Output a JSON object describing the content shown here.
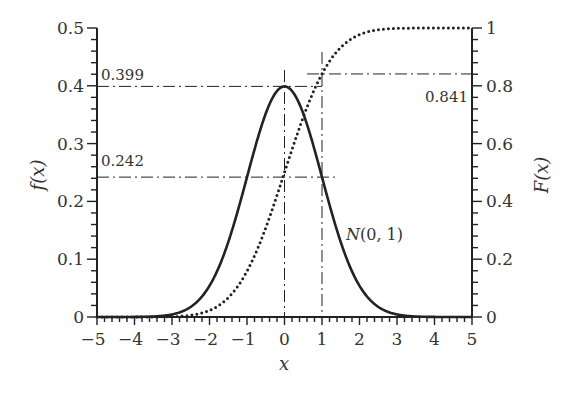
{
  "chart_data": {
    "type": "line",
    "title": "",
    "xlabel": "x",
    "ylabel_left": "f(x)",
    "ylabel_right": "F(x)",
    "xlim": [
      -5,
      5
    ],
    "ylim_left": [
      0,
      0.5
    ],
    "ylim_right": [
      0,
      1
    ],
    "x_ticks": [
      -5,
      -4,
      -3,
      -2,
      -1,
      0,
      1,
      2,
      3,
      4,
      5
    ],
    "x_tick_labels": [
      "−5",
      "−4",
      "−3",
      "−2",
      "−1",
      "0",
      "1",
      "2",
      "3",
      "4",
      "5"
    ],
    "y_left_ticks": [
      0,
      0.1,
      0.2,
      0.3,
      0.4,
      0.5
    ],
    "y_left_tick_labels": [
      "0",
      "0.1",
      "0.2",
      "0.3",
      "0.4",
      "0.5"
    ],
    "y_right_ticks": [
      0,
      0.2,
      0.4,
      0.6,
      0.8,
      1
    ],
    "y_right_tick_labels": [
      "0",
      "0.2",
      "0.4",
      "0.6",
      "0.8",
      "1"
    ],
    "grid": false,
    "series": [
      {
        "name": "f(x) — N(0,1) density",
        "style": "solid",
        "axis": "left",
        "x": [
          -5,
          -4,
          -3,
          -2,
          -1,
          0,
          1,
          2,
          3,
          4,
          5
        ],
        "values": [
          1.5e-06,
          0.000134,
          0.00443,
          0.054,
          0.242,
          0.399,
          0.242,
          0.054,
          0.00443,
          0.000134,
          1.5e-06
        ]
      },
      {
        "name": "F(x) — N(0,1) CDF",
        "style": "dotted",
        "axis": "right",
        "x": [
          -5,
          -4,
          -3,
          -2,
          -1,
          0,
          1,
          2,
          3,
          4,
          5
        ],
        "values": [
          3e-07,
          3.17e-05,
          0.00135,
          0.0228,
          0.159,
          0.5,
          0.841,
          0.977,
          0.99865,
          0.99997,
          1.0
        ]
      }
    ],
    "annotations": [
      {
        "text": "0.399",
        "desc": "peak density f(0)"
      },
      {
        "text": "0.242",
        "desc": "f(±1)"
      },
      {
        "text": "0.841",
        "desc": "F(1)"
      },
      {
        "text": "N(0, 1)",
        "desc": "curve label"
      }
    ]
  },
  "labels": {
    "ann_399": "0.399",
    "ann_242": "0.242",
    "ann_841": "0.841",
    "curve_label": "N(0, 1)",
    "xlabel": "x",
    "ylabel_left": "f(x)",
    "ylabel_right": "F(x)"
  },
  "colors": {
    "ink": "#222222",
    "text": "#333333",
    "background": "#ffffff"
  }
}
